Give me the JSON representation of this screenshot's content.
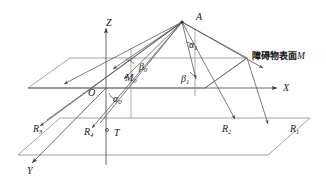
{
  "figure": {
    "title_caption": "",
    "background_color": "#ffffff",
    "line_color": "#4a4a4a",
    "plane_line_color": "#7d7d7d",
    "ray_color": "#555555",
    "text_color": "#1a1a1a",
    "width": 326,
    "height": 180
  },
  "axes": {
    "z": {
      "label": "Z",
      "x": 106,
      "y": 18
    },
    "x": {
      "label": "X",
      "x": 283,
      "y": 83
    },
    "y": {
      "label": "Y",
      "x": 27,
      "y": 166
    }
  },
  "points": {
    "apex": {
      "label": "A",
      "x": 196,
      "y": 12
    },
    "origin": {
      "label": "O",
      "x": 88,
      "y": 88
    },
    "m_zero": {
      "label": "M",
      "sub": "0",
      "x": 125,
      "y": 73
    },
    "t": {
      "label": "T",
      "x": 114,
      "y": 128
    }
  },
  "angles": [
    {
      "name": "alpha-zero",
      "label": "α",
      "sub": "0",
      "x": 113,
      "y": 94
    },
    {
      "name": "beta-zero",
      "label": "β",
      "sub": "0",
      "x": 139,
      "y": 62
    },
    {
      "name": "alpha-one",
      "label": "α",
      "sub": "1",
      "x": 189,
      "y": 40
    },
    {
      "name": "beta-one",
      "label": "β",
      "sub": "1",
      "x": 181,
      "y": 74
    }
  ],
  "rays": [
    {
      "name": "ray-1",
      "label": "R",
      "sub": "1",
      "x": 290,
      "y": 124
    },
    {
      "name": "ray-2",
      "label": "R",
      "sub": "2",
      "x": 222,
      "y": 124
    },
    {
      "name": "ray-3",
      "label": "R",
      "sub": "3",
      "x": 33,
      "y": 124
    },
    {
      "name": "ray-4",
      "label": "R",
      "sub": "4",
      "x": 84,
      "y": 127
    }
  ],
  "annotations": {
    "obstacle_surface": {
      "text": "障碍物表面",
      "italic_suffix": "M",
      "x": 252,
      "y": 52
    }
  }
}
